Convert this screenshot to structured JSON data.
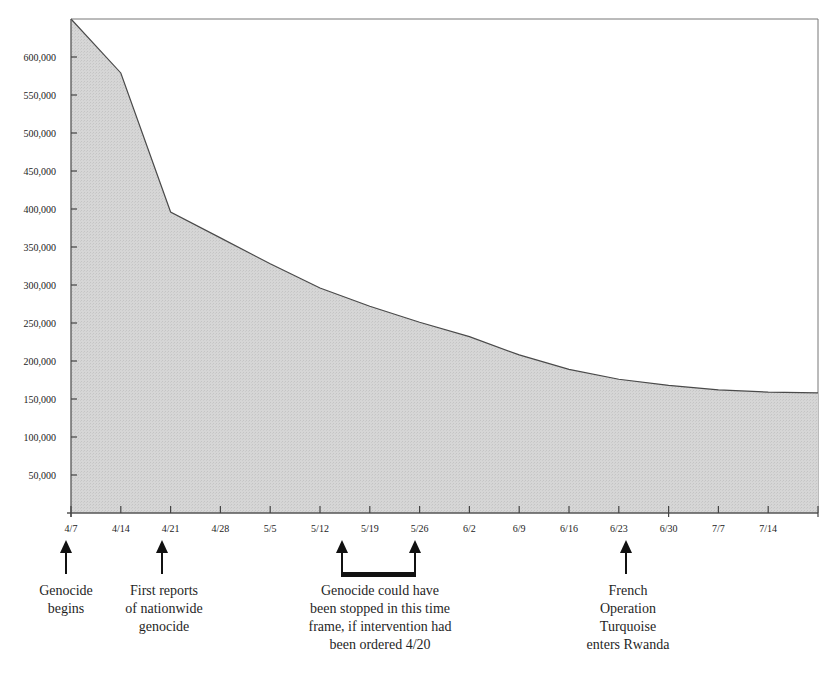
{
  "chart_data": {
    "type": "area",
    "title": "",
    "xlabel": "",
    "ylabel": "",
    "ylim": [
      0,
      650000
    ],
    "grid": false,
    "legend": null,
    "x": [
      "4/7",
      "4/14",
      "4/21",
      "4/28",
      "5/5",
      "5/12",
      "5/19",
      "5/26",
      "6/2",
      "6/9",
      "6/16",
      "6/23",
      "6/30",
      "7/7",
      "7/14",
      "7/21"
    ],
    "values": [
      650000,
      579000,
      396000,
      362000,
      328000,
      296000,
      272000,
      251000,
      232000,
      208000,
      189000,
      176000,
      168000,
      162000,
      159000,
      158000
    ],
    "x_tick_labels": [
      "4/7",
      "4/14",
      "4/21",
      "4/28",
      "5/5",
      "5/12",
      "5/19",
      "5/26",
      "6/2",
      "6/9",
      "6/16",
      "6/23",
      "6/30",
      "7/7",
      "7/14"
    ],
    "y_tick_labels": [
      "50,000",
      "100,000",
      "150,000",
      "200,000",
      "250,000",
      "300,000",
      "350,000",
      "400,000",
      "450,000",
      "500,000",
      "550,000",
      "600,000"
    ],
    "y_tick_values": [
      50000,
      100000,
      150000,
      200000,
      250000,
      300000,
      350000,
      400000,
      450000,
      500000,
      550000,
      600000
    ],
    "fill_color": "#d4d4d4",
    "line_color": "#4a4a4a",
    "annotations": [
      {
        "id": "genocide-begins",
        "x": "4/7",
        "type": "arrow",
        "lines": [
          "Genocide",
          "begins"
        ]
      },
      {
        "id": "first-reports",
        "x": "4/21",
        "type": "arrow",
        "lines": [
          "First reports",
          "of nationwide",
          "genocide"
        ]
      },
      {
        "id": "intervention-window",
        "x_range": [
          "5/15",
          "5/26"
        ],
        "type": "bracket",
        "lines": [
          "Genocide could have",
          "been stopped in this time",
          "frame, if intervention had",
          "been ordered 4/20"
        ]
      },
      {
        "id": "operation-turquoise",
        "x": "6/23",
        "type": "arrow",
        "lines": [
          "French",
          "Operation",
          "Turquoise",
          "enters Rwanda"
        ]
      }
    ]
  }
}
